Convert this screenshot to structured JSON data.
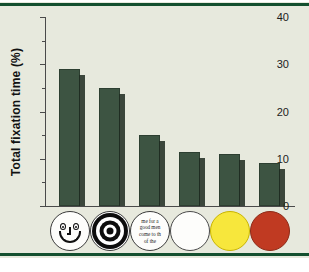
{
  "figure": {
    "background_color": "#e7e9dd",
    "rule_color": "#14502f",
    "bar_color": "#3d5542",
    "bar_shadow_color": "#1d2a20"
  },
  "axes": {
    "y_label": "Total fixation time (%)",
    "y_ticks": [
      "0",
      "10",
      "20",
      "30",
      "40"
    ],
    "y_minor_ticks": [
      5,
      15,
      25,
      35
    ]
  },
  "categories": [
    {
      "id": "face",
      "icon": "smiley-face-icon",
      "label": "Face",
      "value": 29
    },
    {
      "id": "bullseye",
      "icon": "concentric-circles-icon",
      "label": "Concentric circles",
      "value": 25
    },
    {
      "id": "newsprint",
      "icon": "newsprint-text-icon",
      "label": "Newsprint",
      "value": 15,
      "text_lines": [
        "me for a",
        "good men",
        "come to th",
        "of the"
      ]
    },
    {
      "id": "white",
      "icon": "white-disc-icon",
      "label": "White",
      "value": 11.5,
      "color": "#fdfdfb"
    },
    {
      "id": "yellow",
      "icon": "yellow-disc-icon",
      "label": "Yellow",
      "value": 11,
      "color": "#f7e73c"
    },
    {
      "id": "red",
      "icon": "red-disc-icon",
      "label": "Red",
      "value": 9,
      "color": "#c03a22"
    }
  ],
  "chart_data": {
    "type": "bar",
    "title": "",
    "xlabel": "",
    "ylabel": "Total fixation time (%)",
    "categories": [
      "Face",
      "Concentric circles",
      "Newsprint",
      "White",
      "Yellow",
      "Red"
    ],
    "values": [
      29,
      25,
      15,
      11.5,
      11,
      9
    ],
    "ylim": [
      0,
      40
    ],
    "yticks": [
      0,
      10,
      20,
      30,
      40
    ],
    "grid": false,
    "legend": false
  }
}
